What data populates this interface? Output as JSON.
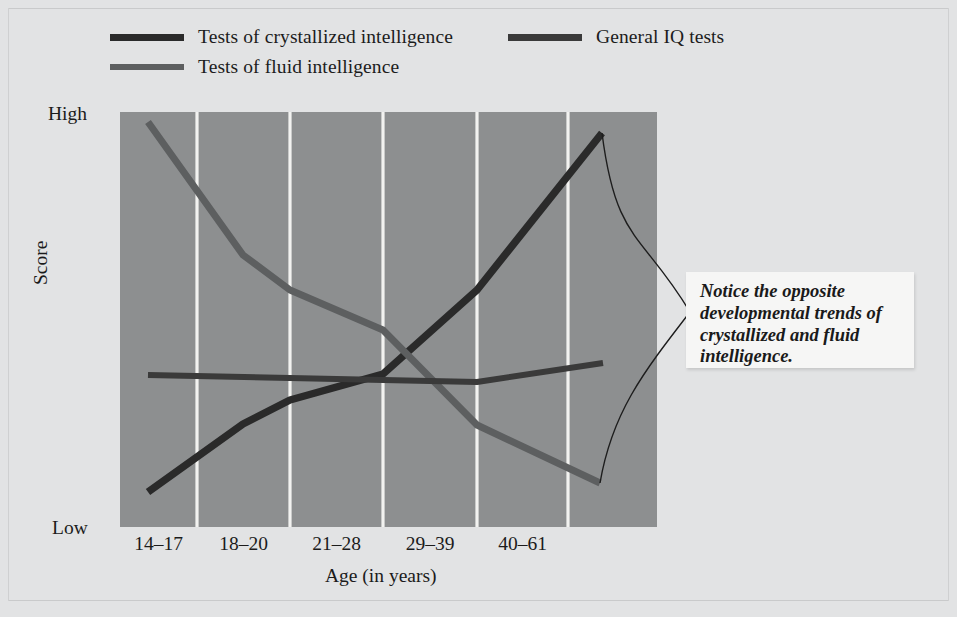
{
  "figure": {
    "background_color": "#e2e3e4",
    "plot_background_color": "#8d8f90",
    "gridline_color": "#f2f2f0"
  },
  "legend": {
    "entries": [
      {
        "label": "Tests of crystallized intelligence",
        "color": "#2a2a2a",
        "series_key": "crystallized"
      },
      {
        "label": "Tests of fluid intelligence",
        "color": "#5d5f60",
        "series_key": "fluid"
      },
      {
        "label": "General IQ tests",
        "color": "#3a3a3a",
        "series_key": "general_iq"
      }
    ]
  },
  "axes": {
    "y_label": "Score",
    "y_high": "High",
    "y_low": "Low",
    "x_label": "Age (in years)"
  },
  "callout": {
    "text": "Notice the opposite developmental trends of crystallized and fluid intelligence.",
    "background_color": "#f6f6f5"
  },
  "chart_data": {
    "type": "line",
    "title": "",
    "xlabel": "Age (in years)",
    "ylabel": "Score",
    "categories": [
      "14–17",
      "18–20",
      "21–28",
      "29–39",
      "40–61"
    ],
    "ylim": [
      "Low",
      "High"
    ],
    "ytick_labels": [
      "Low",
      "High"
    ],
    "grid": "vertical-only",
    "legend_position": "above-plot-left",
    "series": [
      {
        "name": "Tests of crystallized intelligence",
        "color": "#2a2a2a",
        "description": "rises steadily from low at youngest ages to high at oldest ages",
        "values": [
          0.08,
          0.33,
          0.46,
          0.66,
          0.95
        ],
        "points_px": [
          [
            148,
            492
          ],
          [
            243,
            424
          ],
          [
            290,
            400
          ],
          [
            383,
            374
          ],
          [
            477,
            290
          ],
          [
            602,
            133
          ]
        ]
      },
      {
        "name": "Tests of fluid intelligence",
        "color": "#5d5f60",
        "description": "declines steadily from high at youngest ages to low at oldest ages",
        "values": [
          0.96,
          0.6,
          0.47,
          0.3,
          0.11
        ],
        "points_px": [
          [
            148,
            122
          ],
          [
            243,
            255
          ],
          [
            290,
            290
          ],
          [
            383,
            330
          ],
          [
            477,
            425
          ],
          [
            600,
            483
          ]
        ]
      },
      {
        "name": "General IQ tests",
        "color": "#3a3a3a",
        "description": "remains essentially flat across all age groups",
        "values": [
          0.5,
          0.49,
          0.48,
          0.47,
          0.53
        ],
        "points_px": [
          [
            148,
            375
          ],
          [
            290,
            378
          ],
          [
            383,
            380
          ],
          [
            477,
            382
          ],
          [
            603,
            363
          ]
        ]
      }
    ],
    "annotations": [
      {
        "text": "Notice the opposite developmental trends of crystallized and fluid intelligence.",
        "style": "bold-italic-callout-with-brace-leader",
        "points_to": [
          "Tests of crystallized intelligence end",
          "Tests of fluid intelligence end"
        ]
      }
    ]
  }
}
